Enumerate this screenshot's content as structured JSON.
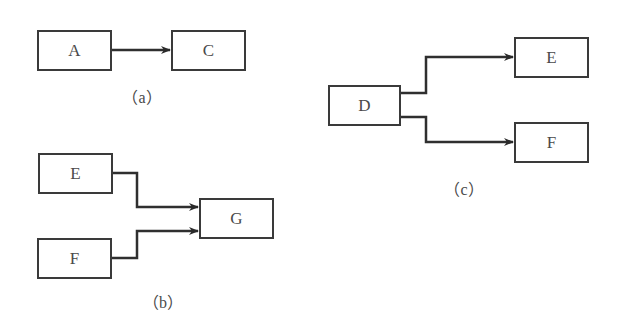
{
  "diagrams": {
    "a": {
      "caption": "（a）",
      "nodes": {
        "A": "A",
        "C": "C"
      },
      "edges": [
        [
          "A",
          "C"
        ]
      ]
    },
    "b": {
      "caption": "（b）",
      "nodes": {
        "E": "E",
        "F": "F",
        "G": "G"
      },
      "edges": [
        [
          "E",
          "G"
        ],
        [
          "F",
          "G"
        ]
      ]
    },
    "c": {
      "caption": "（c）",
      "nodes": {
        "D": "D",
        "E": "E",
        "F": "F"
      },
      "edges": [
        [
          "D",
          "E"
        ],
        [
          "D",
          "F"
        ]
      ]
    }
  },
  "colors": {
    "line": "#333333",
    "text": "#4a4a4a",
    "background": "#ffffff"
  }
}
